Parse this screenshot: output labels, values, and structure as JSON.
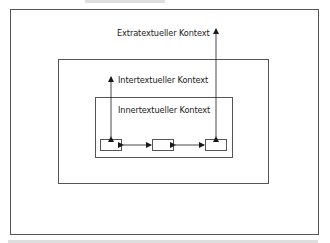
{
  "diagram": {
    "outer": {
      "label": "Extratextueller Kontext"
    },
    "middle": {
      "label": "Intertextueller Kontext"
    },
    "inner": {
      "label": "Innertextueller Kontext"
    },
    "elements": [
      {
        "id": "element-1",
        "label": ""
      },
      {
        "id": "element-2",
        "label": ""
      },
      {
        "id": "element-3",
        "label": ""
      }
    ],
    "colors": {
      "line": "#555555",
      "arrow": "#1a1a1a",
      "text": "#1a1a1a",
      "background": "#ffffff"
    }
  }
}
